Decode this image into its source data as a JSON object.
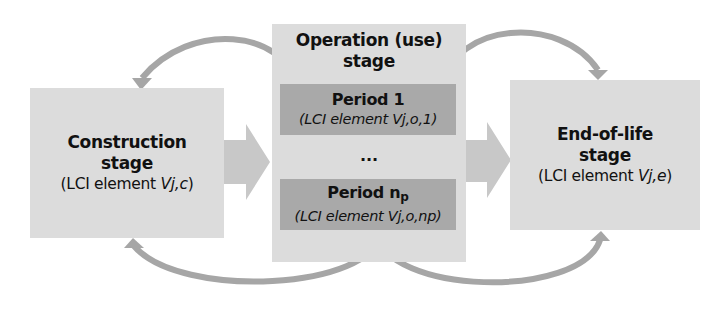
{
  "diagram": {
    "construction": {
      "title_line1": "Construction",
      "title_line2": "stage",
      "sub_prefix": "(LCI element ",
      "sub_var": "Vj,c",
      "sub_suffix": ")"
    },
    "operation": {
      "title_line1": "Operation (use)",
      "title_line2": "stage",
      "period_first": {
        "title": "Period 1",
        "sub": "(LCI element Vj,o,1)"
      },
      "ellipsis": "...",
      "period_last": {
        "title_main": "Period n",
        "title_subscript": "p",
        "sub": "(LCI element Vj,o,np)"
      }
    },
    "end_of_life": {
      "title_line1": "End-of-life",
      "title_line2": "stage",
      "sub_prefix": "(LCI element ",
      "sub_var": "Vj,e",
      "sub_suffix": ")"
    },
    "colors": {
      "stage_box": "#dcdcdc",
      "period_box": "#a9a9a9",
      "arrow": "#c8c8c8",
      "curved_arrow": "#a6a6a6"
    }
  }
}
